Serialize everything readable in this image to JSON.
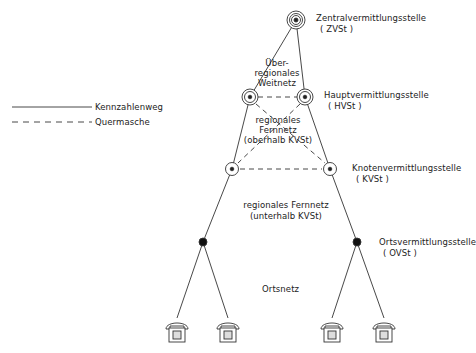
{
  "legend": {
    "solid_label": "Kennzahlenweg",
    "dashed_label": "Quermasche"
  },
  "nodes": {
    "zvst": {
      "name": "Zentralvermittlungsstelle",
      "abbr": "( ZVSt )"
    },
    "hvst": {
      "name": "Hauptvermittlungsstelle",
      "abbr": "( HVSt )"
    },
    "kvst": {
      "name": "Knotenvermittlungsstelle",
      "abbr": "( KVSt )"
    },
    "ovst": {
      "name": "Ortsvermittlungsstelle",
      "abbr": "( OVSt )"
    }
  },
  "regions": {
    "ueberregional": [
      "Über-",
      "regionales",
      "Weitnetz"
    ],
    "oberhalb": [
      "regionales",
      "Fernnetz",
      "(oberhalb KVSt)"
    ],
    "unterhalb": [
      "regionales Fernnetz",
      "(unterhalb KVSt)"
    ],
    "ortsnetz": "Ortsnetz"
  },
  "colors": {
    "line": "#333333",
    "background": "#ffffff"
  }
}
